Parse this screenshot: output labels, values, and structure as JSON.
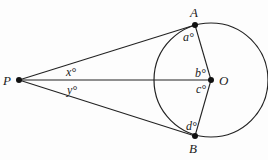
{
  "diagram": {
    "points": {
      "P": {
        "label": "P",
        "x": 19,
        "y": 80
      },
      "O": {
        "label": "O",
        "x": 211,
        "y": 80
      },
      "A": {
        "label": "A",
        "x": 195,
        "y": 25
      },
      "B": {
        "label": "B",
        "x": 195,
        "y": 136
      }
    },
    "circle": {
      "center": "O",
      "radius": 57
    },
    "segments": [
      "PA",
      "PO",
      "PB",
      "OA",
      "OB"
    ],
    "angles": {
      "x": {
        "label": "x°",
        "at": "P",
        "between": "PA,PO"
      },
      "y": {
        "label": "y°",
        "at": "P",
        "between": "PO,PB"
      },
      "a": {
        "label": "a°",
        "at": "A",
        "between": "AP,AO"
      },
      "b": {
        "label": "b°",
        "at": "O",
        "between": "OA,OP"
      },
      "c": {
        "label": "c°",
        "at": "O",
        "between": "OP,OB"
      },
      "d": {
        "label": "d°",
        "at": "B",
        "between": "BO,BP"
      }
    },
    "colors": {
      "stroke": "#222222",
      "background": "#fdfdfd"
    }
  }
}
